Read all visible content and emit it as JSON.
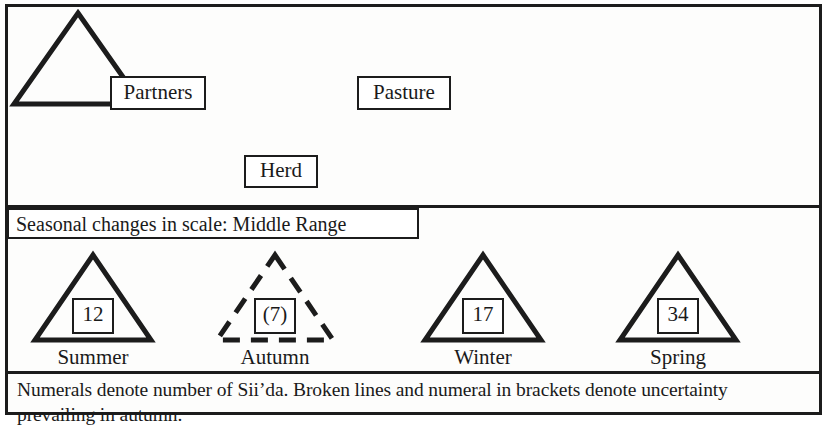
{
  "figure": {
    "model": {
      "nodes": [
        {
          "id": "partners",
          "label": "Partners"
        },
        {
          "id": "pasture",
          "label": "Pasture"
        },
        {
          "id": "herd",
          "label": "Herd"
        }
      ],
      "central_shape": "triangle"
    },
    "scale_band": {
      "label": "Seasonal changes in scale: Middle Range"
    },
    "seasons": [
      {
        "name": "Summer",
        "count": "12",
        "uncertain": false,
        "line_style": "solid"
      },
      {
        "name": "Autumn",
        "count": "(7)",
        "uncertain": true,
        "line_style": "dashed"
      },
      {
        "name": "Winter",
        "count": "17",
        "uncertain": false,
        "line_style": "solid"
      },
      {
        "name": "Spring",
        "count": "34",
        "uncertain": false,
        "line_style": "solid"
      }
    ],
    "footnote": "Numerals denote number of Sii’da. Broken lines and numeral in brackets denote uncertainty prevailing in autumn.",
    "colors": {
      "ink": "#1c1c1c",
      "paper": "#fdfdfc"
    }
  }
}
